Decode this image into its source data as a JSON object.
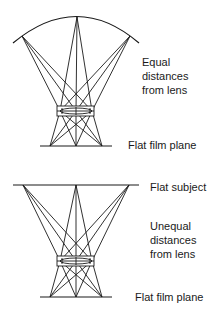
{
  "colors": {
    "line": "#1a1a1a",
    "text": "#1a1a1a",
    "background": "#ffffff"
  },
  "top_panel": {
    "subject_shape": "curved",
    "label_distance": [
      "Equal",
      "distances",
      "from lens"
    ],
    "label_film": "Flat film plane"
  },
  "bottom_panel": {
    "subject_shape": "flat",
    "label_subject": "Flat subject",
    "label_distance": [
      "Unequal",
      "distances",
      "from lens"
    ],
    "label_film": "Flat film plane"
  }
}
